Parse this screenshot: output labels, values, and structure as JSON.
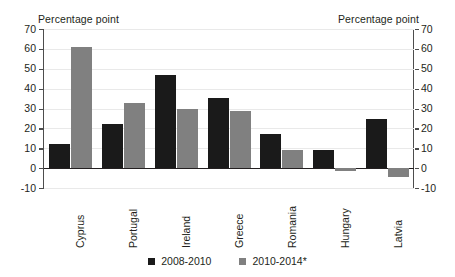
{
  "chart_data": {
    "type": "bar",
    "title": "",
    "subtitle": "",
    "xlabel": "",
    "ylabel": "Percentage point",
    "ylabel_right": "Percentage point",
    "ylim": [
      -10,
      70
    ],
    "yticks": [
      -10,
      0,
      10,
      20,
      30,
      40,
      50,
      60,
      70
    ],
    "ytick_labels": [
      "-10",
      "0",
      "10",
      "20",
      "30",
      "40",
      "50",
      "60",
      "70"
    ],
    "ytick_labels_right": [
      "-10",
      "0",
      "10",
      "20",
      "30",
      "40",
      "50",
      "60",
      "70"
    ],
    "grid": true,
    "legend_position": "bottom",
    "categories": [
      "Cyprus",
      "Portugal",
      "Ireland",
      "Greece",
      "Romania",
      "Hungary",
      "Latvia"
    ],
    "series": [
      {
        "name": "2008-2010",
        "color": "#1a1a1a",
        "values": [
          12.2,
          22.3,
          47.0,
          35.4,
          17.1,
          9.1,
          24.7
        ]
      },
      {
        "name": "2010-2014*",
        "color": "#808080",
        "values": [
          60.8,
          32.6,
          29.9,
          28.7,
          9.3,
          -1.5,
          -4.6
        ]
      }
    ]
  },
  "axis_titles": {
    "left": "Percentage point",
    "right": "Percentage point"
  },
  "colors": {
    "series_0": "#1a1a1a",
    "series_1": "#808080",
    "axis": "#4d4d4d",
    "grid": "#e9e9e9",
    "text": "#231f20",
    "background": "#ffffff"
  }
}
